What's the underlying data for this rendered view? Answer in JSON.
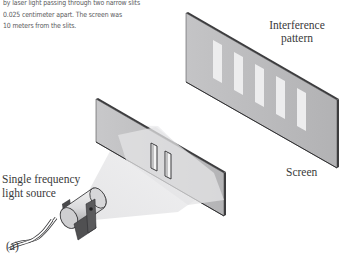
{
  "caption": {
    "lines": [
      "by laser light passing through two narrow slits",
      "0.025 centimeter apart. The screen was",
      "10 meters from the slits."
    ]
  },
  "labels": {
    "interference_pattern_line1": "Interference",
    "interference_pattern_line2": "pattern",
    "screen": "Screen",
    "light_source_line1": "Single frequency",
    "light_source_line2": "light source",
    "panel": "(a)"
  },
  "diagram": {
    "components": [
      "light-source",
      "double-slit-plate",
      "screen"
    ],
    "slit_count": 2,
    "bright_fringe_count": 5,
    "slit_separation": "0.025 centimeter",
    "screen_distance": "10 meters"
  },
  "colors": {
    "panel_gray": "#b9b9bb",
    "edge_dark": "#3c3c3e",
    "fringe_light": "#ededee",
    "beam_light": "#e6e6e8",
    "text": "#3a3a3a"
  }
}
